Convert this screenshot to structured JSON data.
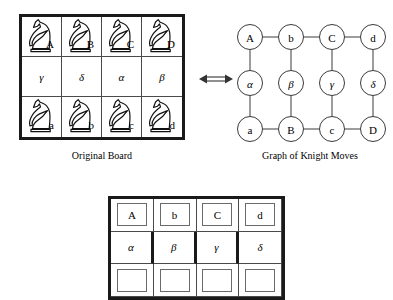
{
  "figure": {
    "equivalence_symbol": "⟺"
  },
  "original_board": {
    "caption": "Original Board",
    "rows": [
      {
        "kind": "knights",
        "cells": [
          {
            "label": "A",
            "icon": "knight-icon"
          },
          {
            "label": "B",
            "icon": "knight-icon"
          },
          {
            "label": "C",
            "icon": "knight-icon"
          },
          {
            "label": "D",
            "icon": "knight-icon"
          }
        ]
      },
      {
        "kind": "greek",
        "cells": [
          {
            "label": "γ"
          },
          {
            "label": "δ"
          },
          {
            "label": "α"
          },
          {
            "label": "β"
          }
        ]
      },
      {
        "kind": "knights",
        "cells": [
          {
            "label": "a",
            "icon": "knight-icon"
          },
          {
            "label": "b",
            "icon": "knight-icon"
          },
          {
            "label": "c",
            "icon": "knight-icon"
          },
          {
            "label": "d",
            "icon": "knight-icon"
          }
        ]
      }
    ]
  },
  "knight_graph": {
    "caption": "Graph of Knight Moves",
    "nodes": [
      {
        "id": "A",
        "label": "A",
        "row": 0,
        "col": 0,
        "greek": false
      },
      {
        "id": "b",
        "label": "b",
        "row": 0,
        "col": 1,
        "greek": false
      },
      {
        "id": "C",
        "label": "C",
        "row": 0,
        "col": 2,
        "greek": false
      },
      {
        "id": "d",
        "label": "d",
        "row": 0,
        "col": 3,
        "greek": false
      },
      {
        "id": "alpha",
        "label": "α",
        "row": 1,
        "col": 0,
        "greek": true
      },
      {
        "id": "beta",
        "label": "β",
        "row": 1,
        "col": 1,
        "greek": true
      },
      {
        "id": "gamma",
        "label": "γ",
        "row": 1,
        "col": 2,
        "greek": true
      },
      {
        "id": "delta",
        "label": "δ",
        "row": 1,
        "col": 3,
        "greek": true
      },
      {
        "id": "a",
        "label": "a",
        "row": 2,
        "col": 0,
        "greek": false
      },
      {
        "id": "B",
        "label": "B",
        "row": 2,
        "col": 1,
        "greek": false
      },
      {
        "id": "c",
        "label": "c",
        "row": 2,
        "col": 2,
        "greek": false
      },
      {
        "id": "D",
        "label": "D",
        "row": 2,
        "col": 3,
        "greek": false
      }
    ],
    "edges": [
      [
        "A",
        "b"
      ],
      [
        "b",
        "C"
      ],
      [
        "C",
        "d"
      ],
      [
        "a",
        "B"
      ],
      [
        "B",
        "c"
      ],
      [
        "c",
        "D"
      ],
      [
        "A",
        "alpha"
      ],
      [
        "alpha",
        "a"
      ],
      [
        "b",
        "beta"
      ],
      [
        "beta",
        "B"
      ],
      [
        "C",
        "gamma"
      ],
      [
        "gamma",
        "c"
      ],
      [
        "d",
        "delta"
      ],
      [
        "delta",
        "D"
      ]
    ]
  },
  "labeled_board": {
    "rows": [
      {
        "boxed": true,
        "cells": [
          {
            "label": "A",
            "greek": false
          },
          {
            "label": "b",
            "greek": false
          },
          {
            "label": "C",
            "greek": false
          },
          {
            "label": "d",
            "greek": false
          }
        ]
      },
      {
        "boxed": false,
        "cells": [
          {
            "label": "α",
            "greek": true
          },
          {
            "label": "β",
            "greek": true
          },
          {
            "label": "γ",
            "greek": true
          },
          {
            "label": "δ",
            "greek": true
          }
        ]
      },
      {
        "boxed": true,
        "cells": [
          {
            "label": "",
            "greek": false
          },
          {
            "label": "",
            "greek": false
          },
          {
            "label": "",
            "greek": false
          },
          {
            "label": "",
            "greek": false
          }
        ]
      }
    ]
  },
  "colors": {
    "board_border": "#1a1a1a",
    "grid_line": "#4a4a4a",
    "node_stroke": "#3a3a3a",
    "background": "#ffffff"
  }
}
